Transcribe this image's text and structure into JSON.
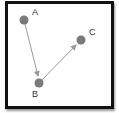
{
  "diagram": {
    "nodes": [
      {
        "id": "A",
        "label": "A",
        "x": 24,
        "y": 20
      },
      {
        "id": "B",
        "label": "B",
        "x": 39,
        "y": 83
      },
      {
        "id": "C",
        "label": "C",
        "x": 81,
        "y": 40
      }
    ],
    "edges": [
      {
        "from": "A",
        "to": "B"
      },
      {
        "from": "B",
        "to": "C"
      }
    ],
    "colors": {
      "node": "#7a7a7a",
      "edge": "#9a9a9a",
      "border": "#111111"
    }
  }
}
